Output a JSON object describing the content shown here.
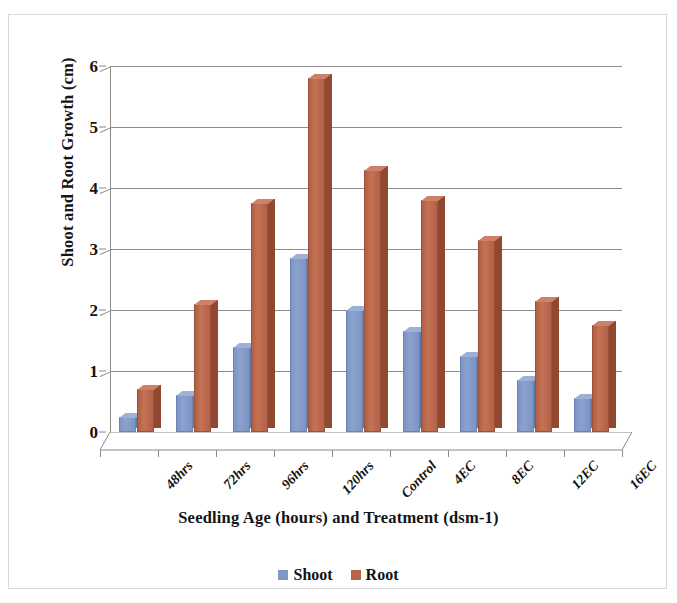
{
  "chart_data": {
    "type": "bar",
    "title": "",
    "xlabel": "Seedling Age  (hours) and Treatment (dsm-1)",
    "ylabel": "Shoot and Root Growth (cm)",
    "categories": [
      "48hrs",
      "72hrs",
      "96hrs",
      "120hrs",
      "Control",
      "4EC",
      "8EC",
      "12EC",
      "16EC"
    ],
    "series": [
      {
        "name": "Shoot",
        "color": "#8098c8",
        "values": [
          0.25,
          0.6,
          1.4,
          2.85,
          2.0,
          1.65,
          1.25,
          0.85,
          0.55
        ]
      },
      {
        "name": "Root",
        "color": "#b5654a",
        "values": [
          0.7,
          2.1,
          3.75,
          5.8,
          4.3,
          3.8,
          3.15,
          2.15,
          1.75
        ]
      }
    ],
    "ylim": [
      0,
      6
    ],
    "yticks": [
      0,
      1,
      2,
      3,
      4,
      5,
      6
    ],
    "ytick_labels": [
      "0",
      "1",
      "2",
      "3",
      "4",
      "5",
      "6"
    ],
    "grid": true,
    "legend_position": "bottom",
    "style": "3d-column"
  },
  "legend": {
    "items": [
      {
        "label": "Shoot",
        "color": "#8098c8"
      },
      {
        "label": "Root",
        "color": "#b5654a"
      }
    ]
  },
  "axes": {
    "y_title": "Shoot and Root Growth (cm)",
    "x_title": "Seedling Age  (hours) and Treatment (dsm-1)"
  }
}
